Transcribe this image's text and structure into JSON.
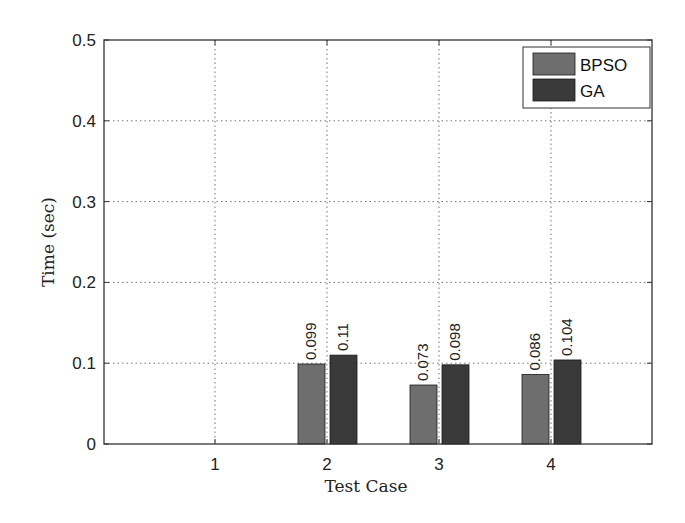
{
  "chart_data": {
    "type": "bar",
    "title": "",
    "xlabel": "Test Case",
    "ylabel": "Time (sec)",
    "categories": [
      "1",
      "2",
      "3",
      "4"
    ],
    "series": [
      {
        "name": "BPSO",
        "values": [
          0,
          0.099,
          0.073,
          0.086
        ],
        "color": "#6e6e6e",
        "labels": [
          "",
          "0.099",
          "0.073",
          "0.086"
        ]
      },
      {
        "name": "GA",
        "values": [
          0,
          0.11,
          0.098,
          0.104
        ],
        "color": "#3a3a3a",
        "labels": [
          "",
          "0.11",
          "0.098",
          "0.104"
        ]
      }
    ],
    "ylim": [
      0,
      0.5
    ],
    "yticks": [
      "0",
      "0.1",
      "0.2",
      "0.3",
      "0.4",
      "0.5"
    ],
    "xticks": [
      "1",
      "2",
      "3",
      "4"
    ],
    "grid": true,
    "legend_position": "upper right"
  }
}
